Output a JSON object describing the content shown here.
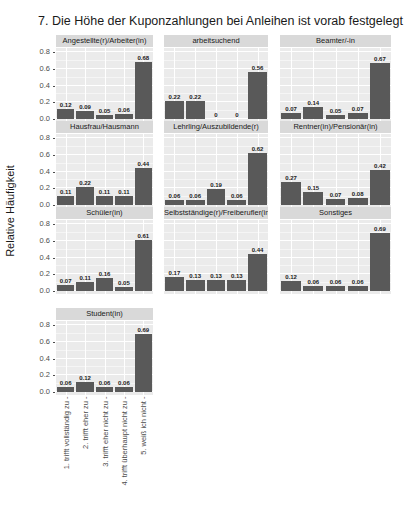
{
  "chart_data": {
    "type": "bar",
    "title": "7. Die Höhe der Kuponzahlungen bei Anleihen ist vorab festgelegt",
    "xlabel": "",
    "ylabel": "Relative Häufigkeit",
    "ylim": [
      0,
      0.8
    ],
    "yticks": [
      "0.0",
      "0.2",
      "0.4",
      "0.6",
      "0.8"
    ],
    "grid": true,
    "facet_wrap": true,
    "categories": [
      "1. trifft vollständig zu",
      "2. trifft eher zu",
      "3. trifft eher nicht zu",
      "4. trifft überhaupt nicht zu",
      "5. weiß ich nicht"
    ],
    "panels": [
      {
        "name": "Angestellte(r)/Arbeiter(in)",
        "values": [
          0.12,
          0.09,
          0.05,
          0.06,
          0.68
        ],
        "labels": [
          "0.12",
          "0.09",
          "0.05",
          "0.06",
          "0.68"
        ]
      },
      {
        "name": "arbeitsuchend",
        "values": [
          0.22,
          0.22,
          0,
          0,
          0.56
        ],
        "labels": [
          "0.22",
          "0.22",
          "0",
          "0",
          "0.56"
        ]
      },
      {
        "name": "Beamter/-in",
        "values": [
          0.07,
          0.14,
          0.05,
          0.07,
          0.67
        ],
        "labels": [
          "0.07",
          "0.14",
          "0.05",
          "0.07",
          "0.67"
        ]
      },
      {
        "name": "Hausfrau/Hausmann",
        "values": [
          0.11,
          0.22,
          0.11,
          0.11,
          0.44
        ],
        "labels": [
          "0.11",
          "0.22",
          "0.11",
          "0.11",
          "0.44"
        ]
      },
      {
        "name": "Lehrling/Auszubildende(r)",
        "values": [
          0.06,
          0.06,
          0.19,
          0.06,
          0.62
        ],
        "labels": [
          "0.06",
          "0.06",
          "0.19",
          "0.06",
          "0.62"
        ]
      },
      {
        "name": "Rentner(in)/Pensionär(in)",
        "values": [
          0.27,
          0.15,
          0.07,
          0.08,
          0.42
        ],
        "labels": [
          "0.27",
          "0.15",
          "0.07",
          "0.08",
          "0.42"
        ]
      },
      {
        "name": "Schüler(in)",
        "values": [
          0.07,
          0.11,
          0.16,
          0.05,
          0.61
        ],
        "labels": [
          "0.07",
          "0.11",
          "0.16",
          "0.05",
          "0.61"
        ]
      },
      {
        "name": "Selbstständige(r)/Freiberufler(in)",
        "values": [
          0.17,
          0.13,
          0.13,
          0.13,
          0.44
        ],
        "labels": [
          "0.17",
          "0.13",
          "0.13",
          "0.13",
          "0.44"
        ]
      },
      {
        "name": "Sonstiges",
        "values": [
          0.12,
          0.06,
          0.06,
          0.06,
          0.69
        ],
        "labels": [
          "0.12",
          "0.06",
          "0.06",
          "0.06",
          "0.69"
        ]
      },
      {
        "name": "Student(in)",
        "values": [
          0.06,
          0.12,
          0.06,
          0.06,
          0.69
        ],
        "labels": [
          "0.06",
          "0.12",
          "0.06",
          "0.06",
          "0.69"
        ]
      }
    ],
    "bar_color": "#595959",
    "panel_background": "#ebebeb",
    "strip_background": "#d9d9d9"
  },
  "xtick_labels": [
    "1. trifft vollständig zu -",
    "2. trifft eher zu -",
    "3. trifft eher nicht zu -",
    "4. trifft überhaupt nicht zu -",
    "5. weiß ich nicht -"
  ]
}
